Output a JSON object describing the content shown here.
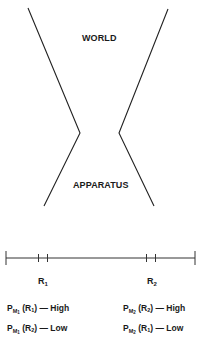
{
  "diagram": {
    "top_label": "WORLD",
    "bottom_label": "APPARATUS",
    "line_color": "#222222"
  },
  "axis": {
    "regions": [
      {
        "name": "R",
        "index": "1"
      },
      {
        "name": "R",
        "index": "2"
      }
    ]
  },
  "probabilities": {
    "left": [
      {
        "p": "P",
        "m": "M",
        "m_index": "1",
        "r": "R",
        "r_index": "1",
        "dash": "—",
        "value": "High"
      },
      {
        "p": "P",
        "m": "M",
        "m_index": "1",
        "r": "R",
        "r_index": "2",
        "dash": "—",
        "value": "Low"
      }
    ],
    "right": [
      {
        "p": "P",
        "m": "M",
        "m_index": "2",
        "r": "R",
        "r_index": "2",
        "dash": "—",
        "value": "High"
      },
      {
        "p": "P",
        "m": "M",
        "m_index": "2",
        "r": "R",
        "r_index": "1",
        "dash": "—",
        "value": "Low"
      }
    ]
  }
}
